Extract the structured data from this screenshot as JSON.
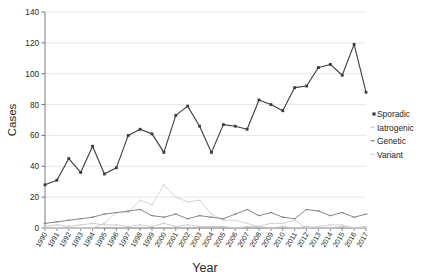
{
  "chart_data": {
    "type": "line",
    "title": "",
    "xlabel": "Year",
    "ylabel": "Cases",
    "ylim": [
      0,
      140
    ],
    "yticks": [
      0,
      20,
      40,
      60,
      80,
      100,
      120,
      140
    ],
    "grid": true,
    "legend_position": "right",
    "categories": [
      "1990",
      "1991",
      "1992",
      "1993",
      "1994",
      "1995",
      "1996",
      "1997",
      "1998",
      "1999",
      "2000",
      "2001",
      "2002",
      "2003",
      "2004",
      "2005",
      "2006",
      "2007",
      "2008",
      "2009",
      "2010",
      "2011",
      "2012",
      "2013",
      "2014",
      "2015",
      "2016",
      "2017"
    ],
    "series": [
      {
        "name": "Sporadic",
        "color": "#3b3b3b",
        "marker": "square",
        "values": [
          28,
          31,
          45,
          36,
          53,
          35,
          39,
          60,
          64,
          61,
          49,
          73,
          79,
          66,
          49,
          67,
          66,
          64,
          83,
          80,
          76,
          91,
          92,
          104,
          106,
          99,
          119,
          88
        ]
      },
      {
        "name": "Iatrogenic",
        "color": "#c9c9c9",
        "marker": "dash",
        "values": [
          1,
          2,
          1,
          2,
          3,
          2,
          2,
          1,
          2,
          1,
          3,
          1,
          2,
          1,
          1,
          1,
          0,
          1,
          1,
          0,
          1,
          0,
          1,
          0,
          0,
          1,
          0,
          0
        ]
      },
      {
        "name": "Genetic",
        "color": "#7a7a7a",
        "marker": "dash",
        "values": [
          3,
          4,
          5,
          6,
          7,
          9,
          10,
          11,
          12,
          8,
          7,
          9,
          6,
          8,
          7,
          6,
          9,
          12,
          8,
          10,
          7,
          6,
          12,
          11,
          8,
          10,
          7,
          9
        ]
      },
      {
        "name": "Variant",
        "color": "#d0d0d0",
        "marker": "dash",
        "values": [
          0,
          0,
          0,
          0,
          0,
          3,
          10,
          10,
          18,
          15,
          28,
          20,
          17,
          18,
          9,
          5,
          5,
          3,
          1,
          3,
          3,
          5,
          0,
          1,
          2,
          2,
          0,
          1
        ]
      }
    ]
  }
}
